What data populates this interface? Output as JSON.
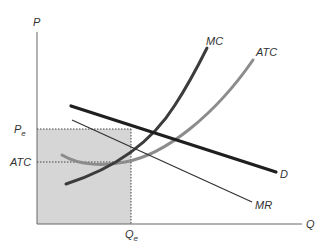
{
  "diagram": {
    "type": "monopoly_profit_maximization",
    "axes": {
      "y_label": "P",
      "x_label": "Q"
    },
    "curves": {
      "mc": {
        "label": "MC",
        "color": "#3a3a3a"
      },
      "atc": {
        "label": "ATC",
        "color": "#8a8a8a"
      },
      "demand": {
        "label": "D",
        "color": "#1f1f1f"
      },
      "mr": {
        "label": "MR",
        "color": "#333333"
      }
    },
    "levels": {
      "price": {
        "label_main": "P",
        "label_sub": "e"
      },
      "atc": {
        "label": "ATC"
      },
      "quantity": {
        "label_main": "Q",
        "label_sub": "e"
      }
    },
    "shaded_region": {
      "color": "#d4d4d4",
      "meaning": "total revenue area P_e × Q_e"
    }
  }
}
